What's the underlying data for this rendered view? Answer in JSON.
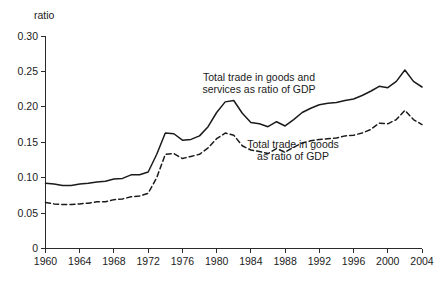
{
  "chart_data": {
    "type": "line",
    "title": "",
    "subtitle": "",
    "xlabel": "",
    "ylabel": "ratio",
    "ylabel_position": "top-left",
    "xlim": [
      1960,
      2004
    ],
    "ylim": [
      0,
      0.3
    ],
    "grid": false,
    "legend_position": "inline-annotations",
    "y_ticks": [
      "0",
      "0.05",
      "0.10",
      "0.15",
      "0.20",
      "0.25",
      "0.30"
    ],
    "y_tick_values": [
      0,
      0.05,
      0.1,
      0.15,
      0.2,
      0.25,
      0.3
    ],
    "x_ticks": [
      "1960",
      "1964",
      "1968",
      "1972",
      "1976",
      "1980",
      "1984",
      "1988",
      "1992",
      "1996",
      "2000",
      "2004"
    ],
    "x_tick_values": [
      1960,
      1964,
      1968,
      1972,
      1976,
      1980,
      1984,
      1988,
      1992,
      1996,
      2000,
      2004
    ],
    "x": [
      1960,
      1961,
      1962,
      1963,
      1964,
      1965,
      1966,
      1967,
      1968,
      1969,
      1970,
      1971,
      1972,
      1973,
      1974,
      1975,
      1976,
      1977,
      1978,
      1979,
      1980,
      1981,
      1982,
      1983,
      1984,
      1985,
      1986,
      1987,
      1988,
      1989,
      1990,
      1991,
      1992,
      1993,
      1994,
      1995,
      1996,
      1997,
      1998,
      1999,
      2000,
      2001,
      2002,
      2003,
      2004
    ],
    "series": [
      {
        "name": "Total trade in goods and services as ratio of GDP",
        "style": "solid",
        "color": "#1b1b1b",
        "annotation": "Total trade in goods and\nservices as ratio of GDP",
        "values": [
          0.092,
          0.091,
          0.089,
          0.089,
          0.091,
          0.092,
          0.094,
          0.095,
          0.098,
          0.099,
          0.104,
          0.104,
          0.108,
          0.133,
          0.163,
          0.162,
          0.153,
          0.154,
          0.159,
          0.172,
          0.192,
          0.207,
          0.209,
          0.191,
          0.178,
          0.176,
          0.172,
          0.179,
          0.173,
          0.182,
          0.192,
          0.198,
          0.203,
          0.205,
          0.206,
          0.209,
          0.211,
          0.216,
          0.222,
          0.229,
          0.227,
          0.236,
          0.252,
          0.236,
          0.228
        ]
      },
      {
        "name": "Total trade in goods as ratio of GDP",
        "style": "dashed",
        "color": "#1b1b1b",
        "annotation": "Total trade in goods\nas ratio of GDP",
        "values": [
          0.065,
          0.063,
          0.062,
          0.062,
          0.063,
          0.064,
          0.066,
          0.066,
          0.069,
          0.07,
          0.073,
          0.074,
          0.078,
          0.1,
          0.133,
          0.134,
          0.127,
          0.13,
          0.133,
          0.142,
          0.155,
          0.163,
          0.16,
          0.145,
          0.139,
          0.137,
          0.134,
          0.141,
          0.136,
          0.143,
          0.149,
          0.152,
          0.154,
          0.155,
          0.156,
          0.159,
          0.16,
          0.163,
          0.168,
          0.177,
          0.176,
          0.182,
          0.195,
          0.182,
          0.175
        ]
      }
    ],
    "annotations": [
      {
        "id": "series1-label",
        "lines": [
          "Total trade in goods and",
          "services as ratio of GDP"
        ],
        "x_px": 259,
        "y_px": 81
      },
      {
        "id": "series2-label",
        "lines": [
          "Total trade in goods",
          "as ratio of GDP"
        ],
        "x_px": 293,
        "y_px": 148
      }
    ]
  }
}
